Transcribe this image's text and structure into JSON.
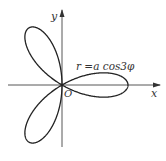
{
  "diagram": {
    "type": "polar-curve",
    "equation_label": "r =a cos3φ",
    "axes": {
      "x_label": "x",
      "y_label": "y",
      "origin_label": "O"
    },
    "curve": {
      "formula": "r = a cos(3φ)",
      "petals": 3,
      "petal_directions_deg": [
        0,
        120,
        240
      ]
    },
    "colors": {
      "stroke": "#222222",
      "axis": "#444444",
      "background": "#ffffff"
    }
  }
}
